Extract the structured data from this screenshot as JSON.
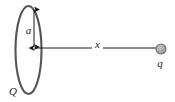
{
  "figure": {
    "background_color": "#ffffff",
    "width": 175,
    "height": 102,
    "labels": {
      "ring_charge": "Q",
      "ring_radius": "a",
      "axial_distance": "x",
      "point_charge": "q"
    },
    "colors": {
      "ring_stroke": "#555555",
      "arrow_stroke": "#1a1a1a",
      "charge_fill": "#a8a8a8",
      "charge_stroke": "#6e6e6e",
      "label_color": "#1a1a1a"
    },
    "geometry": {
      "ring_center_x": 28.5,
      "ring_center_y": 50,
      "ring_rx": 13,
      "ring_ry": 44,
      "axis_y": 48,
      "axis_start_x": 34,
      "axis_end_x": 156,
      "radius_arrow_x": 34,
      "radius_arrow_top_y": 8,
      "radius_arrow_bottom_y": 47,
      "charge_center_x": 161,
      "charge_center_y": 49,
      "charge_radius": 5
    }
  }
}
